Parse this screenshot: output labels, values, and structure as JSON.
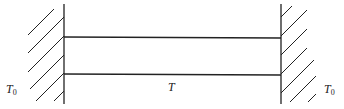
{
  "diagram": {
    "labels": {
      "left_wall_temp": "T",
      "left_wall_temp_sub": "0",
      "rod_temp": "T",
      "right_wall_temp": "T",
      "right_wall_temp_sub": "0"
    },
    "colors": {
      "stroke": "#222222",
      "background": "#ffffff"
    }
  }
}
